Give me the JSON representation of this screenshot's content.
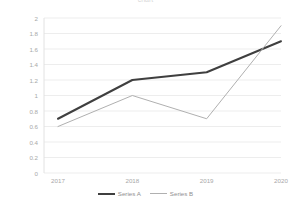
{
  "clipped_header": "chart",
  "chart_data": {
    "type": "line",
    "title": "",
    "xlabel": "",
    "ylabel": "",
    "categories": [
      "2017",
      "2018",
      "2019",
      "2020"
    ],
    "ylim": [
      0,
      2
    ],
    "ytick_labels": [
      "2",
      "1.8",
      "1.6",
      "1.4",
      "1.2",
      "1",
      "0.8",
      "0.6",
      "0.4",
      "0.2",
      "0"
    ],
    "ytick_values": [
      2,
      1.8,
      1.6,
      1.4,
      1.2,
      1,
      0.8,
      0.6,
      0.4,
      0.2,
      0
    ],
    "grid": true,
    "grid_color": "#ededed",
    "legend_position": "bottom",
    "series": [
      {
        "name": "Series A",
        "values": [
          0.7,
          1.2,
          1.3,
          1.7
        ],
        "color": "#3f3f3f",
        "width": 2
      },
      {
        "name": "Series B",
        "values": [
          0.6,
          1.0,
          0.7,
          1.9
        ],
        "color": "#b0b0b0",
        "width": 1
      }
    ]
  }
}
